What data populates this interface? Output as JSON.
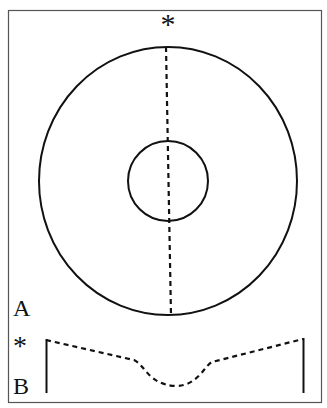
{
  "figure": {
    "top_marker": "*",
    "panel_a_label": "A",
    "panel_b_marker": "*",
    "panel_b_label": "B"
  },
  "colors": {
    "stroke": "#111111",
    "border": "#555555",
    "background": "#ffffff"
  },
  "shapes": {
    "outer_ellipse": {
      "cx": 168,
      "cy": 181,
      "rx": 129,
      "ry": 134
    },
    "inner_circle": {
      "cx": 168,
      "cy": 181,
      "r": 40
    },
    "dashed_meridian": {
      "x1": 166,
      "y1": 47,
      "x2": 171,
      "y2": 315
    }
  }
}
